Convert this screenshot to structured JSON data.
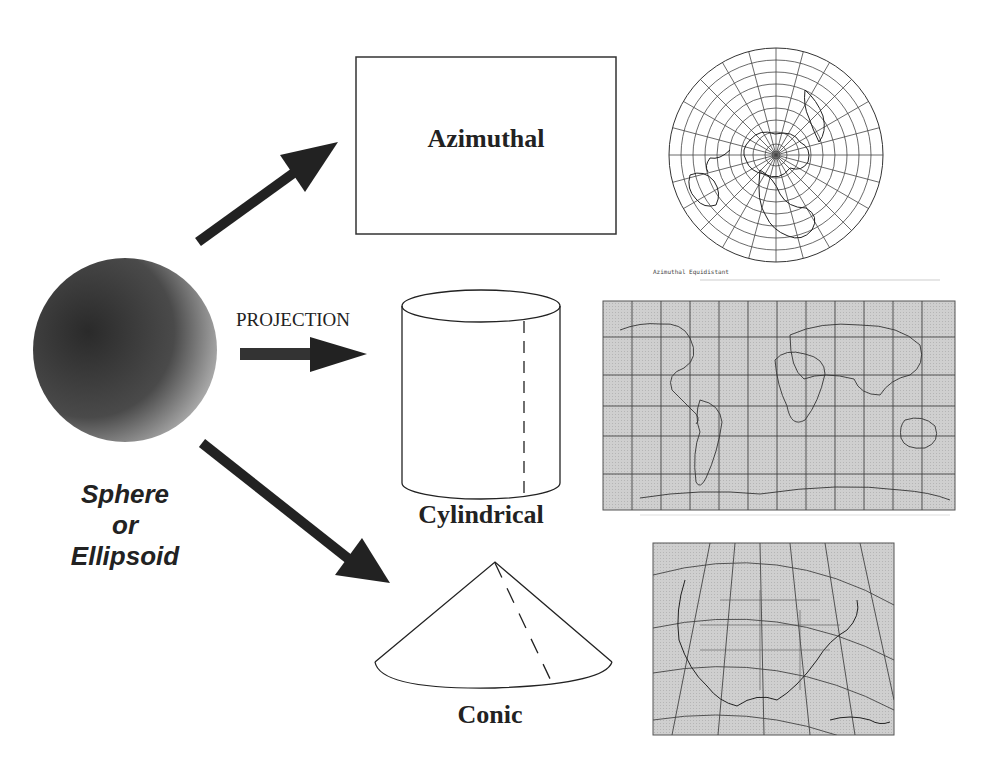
{
  "diagram": {
    "source": {
      "shape": "sphere",
      "label_lines": [
        "Sphere",
        "or",
        "Ellipsoid"
      ]
    },
    "arrow_label": "PROJECTION",
    "projections": [
      {
        "id": "azimuthal",
        "shape": "plane",
        "label": "Azimuthal",
        "map_caption": "Azimuthal Equidistant",
        "map": "polar-grid-world"
      },
      {
        "id": "cylindrical",
        "shape": "cylinder",
        "label": "Cylindrical",
        "map": "world-rectangular-grid"
      },
      {
        "id": "conic",
        "shape": "cone",
        "label": "Conic",
        "map": "north-america-conic-grid"
      }
    ],
    "colors": {
      "background": "#ffffff",
      "arrow": "#222222",
      "map_fill": "#c8c8c8",
      "line": "#222222"
    }
  }
}
